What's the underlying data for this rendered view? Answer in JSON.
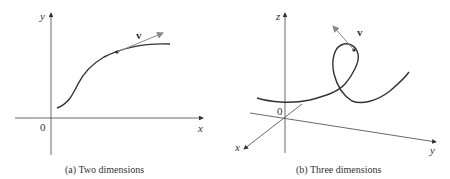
{
  "panels": [
    {
      "id": "a",
      "caption": "(a) Two dimensions",
      "axes": {
        "x_label": "x",
        "y_label": "y",
        "origin_label": "0"
      },
      "vector_label": "v",
      "description": "Planar S-shaped curve with tangent vector v at a point"
    },
    {
      "id": "b",
      "caption": "(b) Three dimensions",
      "axes": {
        "x_label": "x",
        "y_label": "y",
        "z_label": "z",
        "origin_label": "0"
      },
      "vector_label": "v",
      "description": "Space curve with a loop and tangent vector v at a point"
    }
  ],
  "colors": {
    "axis": "#444444",
    "curve": "#333333",
    "vector": "#888888",
    "text": "#333333"
  }
}
